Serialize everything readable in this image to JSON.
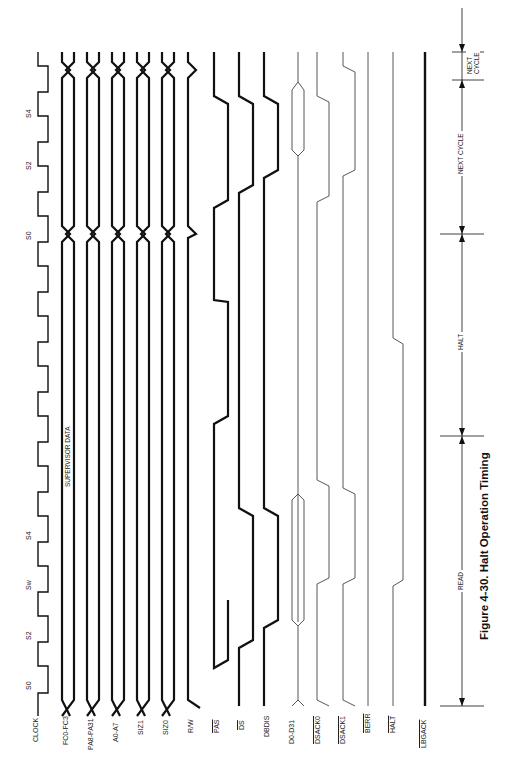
{
  "figure": {
    "caption": "Figure 4-30. Halt Operation Timing",
    "annotation": "SUPERVISOR DATA"
  },
  "signals": [
    {
      "name": "CLOCK",
      "overline": false
    },
    {
      "name": "FC0-FC3",
      "overline": false
    },
    {
      "name": "PA8-PA31",
      "overline": false
    },
    {
      "name": "A0-A7",
      "overline": false
    },
    {
      "name": "SIZ1",
      "overline": false
    },
    {
      "name": "SIZ0",
      "overline": false
    },
    {
      "name": "R/W",
      "overline": false,
      "overline_part": "W"
    },
    {
      "name": "PAS",
      "overline": true
    },
    {
      "name": "DS",
      "overline": true
    },
    {
      "name": "DBDIS",
      "overline": false
    },
    {
      "name": "D0-D31",
      "overline": false
    },
    {
      "name": "DSACK0",
      "overline": true
    },
    {
      "name": "DSACK1",
      "overline": true
    },
    {
      "name": "BERR",
      "overline": true
    },
    {
      "name": "HALT",
      "overline": true
    },
    {
      "name": "LBGACK",
      "overline": true
    }
  ],
  "clock_states": [
    "S0",
    "S2",
    "Sw",
    "S4",
    "S0",
    "S2",
    "S4"
  ],
  "phases": [
    {
      "label": "READ"
    },
    {
      "label": "HALT"
    },
    {
      "label": "NEXT CYCLE"
    },
    {
      "label": "NEXT CYCLE",
      "two_line": [
        "NEXT",
        "CYCLE"
      ]
    }
  ]
}
